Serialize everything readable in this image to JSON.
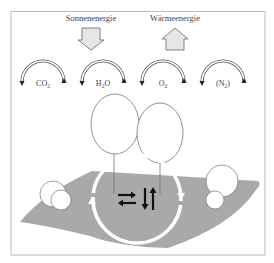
{
  "energy": {
    "solar": {
      "label": "Sonnenenergie",
      "direction": "down"
    },
    "heat": {
      "label": "Wärmeenergie",
      "direction": "up"
    }
  },
  "cycles": [
    {
      "label": "CO",
      "sub": "2"
    },
    {
      "label": "H",
      "sub": "2",
      "suffix": "O"
    },
    {
      "label": "O",
      "sub": "2"
    },
    {
      "label": "(N",
      "sub": "2",
      "suffix": ")"
    }
  ],
  "center": {
    "symbols": "⇄ ⇅"
  },
  "colors": {
    "landmass": "#a9a9a9",
    "frame": "#bbbbbb",
    "arrow_fill": "#e6e6e6",
    "stroke": "#555555"
  }
}
